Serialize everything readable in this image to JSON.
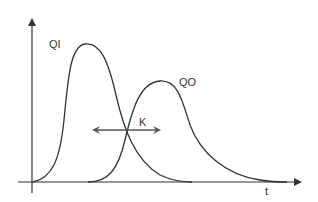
{
  "diagram": {
    "type": "hydrograph",
    "labels": {
      "inflow": "QI",
      "outflow": "QO",
      "lag": "K",
      "time_axis": "t"
    },
    "colors": {
      "line": "#333333",
      "axis": "#333333",
      "lag_arrow": "#666666",
      "background": "#ffffff"
    },
    "curves": [
      {
        "name": "QI",
        "description": "inflow hydrograph, early sharp peak"
      },
      {
        "name": "QO",
        "description": "outflow hydrograph, delayed attenuated peak"
      }
    ],
    "annotation": {
      "name": "K",
      "description": "double-headed arrow indicating storage/lag constant between curves"
    }
  }
}
